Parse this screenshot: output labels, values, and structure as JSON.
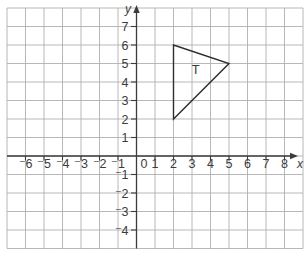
{
  "chart_data": {
    "type": "scatter",
    "grid": true,
    "colors": {
      "grid": "#b0b0b0",
      "axis": "#3c3c3c",
      "text": "#3c3c3c",
      "shape": "#2e2e2e",
      "background": "#ffffff"
    },
    "x_axis": {
      "label": "x",
      "grid_range": [
        -7,
        9
      ],
      "ticks": [
        {
          "v": -6,
          "label": "⁻6"
        },
        {
          "v": -5,
          "label": "⁻5"
        },
        {
          "v": -4,
          "label": "⁻4"
        },
        {
          "v": -3,
          "label": "⁻3"
        },
        {
          "v": -2,
          "label": "⁻2"
        },
        {
          "v": -1,
          "label": "⁻1"
        },
        {
          "v": 0,
          "label": "0"
        },
        {
          "v": 1,
          "label": "1"
        },
        {
          "v": 2,
          "label": "2"
        },
        {
          "v": 3,
          "label": "3"
        },
        {
          "v": 4,
          "label": "4"
        },
        {
          "v": 5,
          "label": "5"
        },
        {
          "v": 6,
          "label": "6"
        },
        {
          "v": 7,
          "label": "7"
        },
        {
          "v": 8,
          "label": "8"
        }
      ]
    },
    "y_axis": {
      "label": "y",
      "grid_range": [
        -5,
        8
      ],
      "ticks": [
        {
          "v": 7,
          "label": "7"
        },
        {
          "v": 6,
          "label": "6"
        },
        {
          "v": 5,
          "label": "5"
        },
        {
          "v": 4,
          "label": "4"
        },
        {
          "v": 3,
          "label": "3"
        },
        {
          "v": 2,
          "label": "2"
        },
        {
          "v": 1,
          "label": "1"
        },
        {
          "v": -1,
          "label": "⁻1"
        },
        {
          "v": -2,
          "label": "⁻2"
        },
        {
          "v": -3,
          "label": "⁻3"
        },
        {
          "v": -4,
          "label": "⁻4"
        }
      ]
    },
    "shapes": [
      {
        "id": "T",
        "label": "T",
        "vertices": [
          [
            2,
            6
          ],
          [
            5,
            5
          ],
          [
            2,
            2
          ]
        ],
        "label_pos": [
          3.2,
          4.7
        ]
      }
    ]
  }
}
